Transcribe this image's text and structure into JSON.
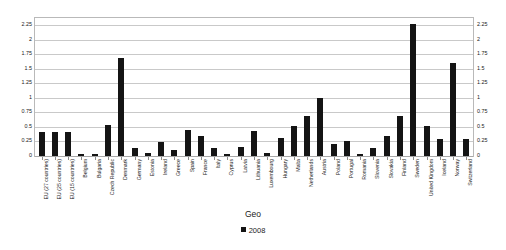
{
  "chart_data": {
    "type": "bar",
    "title": "",
    "subtitle": "",
    "xlabel": "Geo",
    "ylabel": "",
    "ylim": [
      0,
      2.375
    ],
    "yticks": [
      0,
      0.25,
      0.5,
      0.75,
      1,
      1.25,
      1.5,
      1.75,
      2,
      2.25
    ],
    "ytick_labels": [
      "0",
      "0.25",
      "0.5",
      "0.75",
      "1",
      "1.25",
      "1.5",
      "1.75",
      "2",
      "2.25"
    ],
    "grid": true,
    "dual_y_axis": true,
    "legend_position": "bottom",
    "legend": [
      "2008"
    ],
    "series_color": "#141414",
    "categories": [
      "EU (27 countries)",
      "EU (25 countries)",
      "EU (15 countries)",
      "Belgium",
      "Bulgaria",
      "Czech Republic",
      "Denmark",
      "Germany",
      "Estonia",
      "Ireland",
      "Greece",
      "Spain",
      "France",
      "Italy",
      "Cyprus",
      "Latvia",
      "Lithuania",
      "Luxembourg",
      "Hungary",
      "Malta",
      "Netherlands",
      "Austria",
      "Poland",
      "Portugal",
      "Romania",
      "Slovenia",
      "Slovakia",
      "Finland",
      "Sweden",
      "United Kingdom",
      "Iceland",
      "Norway",
      "Switzerland"
    ],
    "series": [
      {
        "name": "2008",
        "values": [
          0.41,
          0.42,
          0.42,
          0.04,
          0.03,
          0.53,
          1.68,
          0.14,
          0.06,
          0.24,
          0.11,
          0.44,
          0.35,
          0.13,
          0.04,
          0.15,
          0.43,
          0.06,
          0.31,
          0.52,
          0.69,
          1.0,
          0.21,
          0.25,
          0.03,
          0.14,
          0.35,
          0.69,
          2.28,
          0.51,
          0.29,
          1.6,
          0.29
        ]
      }
    ]
  },
  "axis_title": "Geo",
  "legend_entry": "2008"
}
